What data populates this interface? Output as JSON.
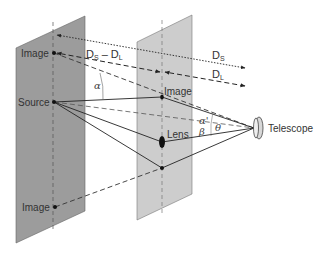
{
  "figure": {
    "colors": {
      "source_plane": "#9c9c9c",
      "lens_plane": "#cdcdcd",
      "line": "#222222",
      "text": "#333333"
    },
    "source_plane": {
      "labels": {
        "image_top": "Image",
        "source": "Source",
        "image_bottom": "Image"
      }
    },
    "lens_plane": {
      "labels": {
        "image": "Image",
        "lens": "Lens"
      }
    },
    "observer": {
      "label": "Telescope",
      "icon": "telescope-icon"
    },
    "distances": {
      "ds_minus_dl": {
        "main": "D",
        "sub1": "S",
        "dash": " – D",
        "sub2": "L"
      },
      "ds": {
        "main": "D",
        "sub": "S"
      },
      "dl": {
        "main": "D",
        "sub": "L"
      }
    },
    "angles": {
      "alpha": "α",
      "alpha_prime": "α'",
      "beta": "β",
      "theta": "θ"
    }
  }
}
